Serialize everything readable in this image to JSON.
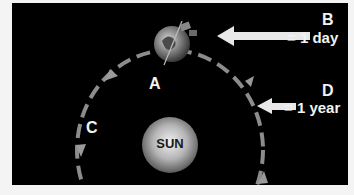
{
  "diagram": {
    "labels": {
      "a": "A",
      "b": "B",
      "c": "C",
      "d": "D",
      "sun": "SUN",
      "b_value": "= 1 day",
      "d_value": "= 1 year"
    },
    "colors": {
      "background": "#000000",
      "orbit": "#8c8c8c",
      "arrow": "#e8e8e8",
      "text": "#f2f2f2"
    }
  }
}
